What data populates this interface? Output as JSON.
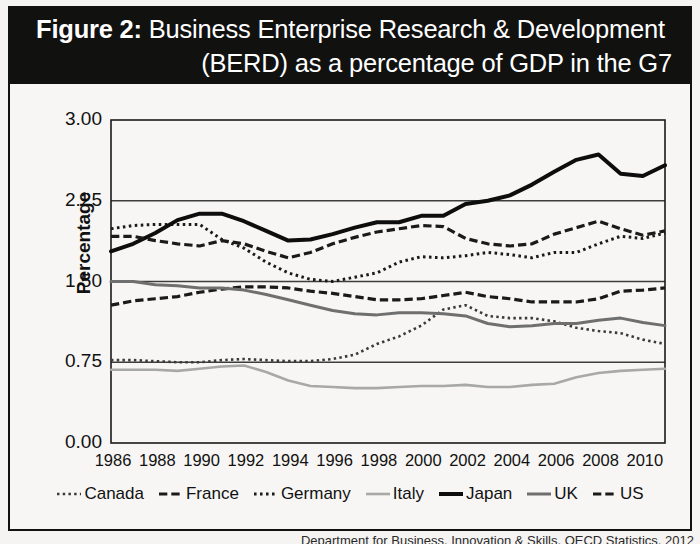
{
  "title": {
    "prefix": "Figure 2:",
    "line1": "Business Enterprise Research & Development",
    "line2": "(BERD) as a percentage of GDP in the G7"
  },
  "source_note": "Department for Business, Innovation & Skills, OECD Statistics, 2012",
  "axis": {
    "ylabel": "Percentage",
    "yticks": [
      "0.00",
      "0.75",
      "1.50",
      "2.25",
      "3.00"
    ],
    "xticks": [
      "1986",
      "1988",
      "1990",
      "1992",
      "1994",
      "1996",
      "1998",
      "2000",
      "2002",
      "2004",
      "2006",
      "2008",
      "2010"
    ]
  },
  "legend": {
    "items": [
      {
        "label": "Canada",
        "style": "dotted",
        "color": "#3a3a3a",
        "width": 2.6
      },
      {
        "label": "France",
        "style": "dashed",
        "color": "#1a1a1a",
        "width": 3.2
      },
      {
        "label": "Germany",
        "style": "finedotted",
        "color": "#1a1a1a",
        "width": 3.0
      },
      {
        "label": "Italy",
        "style": "solid",
        "color": "#a8a8a8",
        "width": 2.6
      },
      {
        "label": "Japan",
        "style": "solid",
        "color": "#0d0d0d",
        "width": 4.0
      },
      {
        "label": "UK",
        "style": "solid",
        "color": "#6f6f6f",
        "width": 3.0
      },
      {
        "label": "US",
        "style": "dashed",
        "color": "#1a1a1a",
        "width": 3.2
      }
    ]
  },
  "chart_data": {
    "type": "line",
    "title": "Figure 2: Business Enterprise Research & Development (BERD) as a percentage of GDP in the G7",
    "xlabel": "",
    "ylabel": "Percentage",
    "ylim": [
      0.0,
      3.0
    ],
    "xlim": [
      1986,
      2011
    ],
    "yticks": [
      0.0,
      0.75,
      1.5,
      2.25,
      3.0
    ],
    "grid": "horizontal",
    "legend_position": "bottom",
    "x": [
      1986,
      1987,
      1988,
      1989,
      1990,
      1991,
      1992,
      1993,
      1994,
      1995,
      1996,
      1997,
      1998,
      1999,
      2000,
      2001,
      2002,
      2003,
      2004,
      2005,
      2006,
      2007,
      2008,
      2009,
      2010,
      2011
    ],
    "series": [
      {
        "name": "Canada",
        "values": [
          0.77,
          0.77,
          0.76,
          0.75,
          0.75,
          0.77,
          0.78,
          0.77,
          0.76,
          0.76,
          0.78,
          0.82,
          0.92,
          0.99,
          1.09,
          1.24,
          1.28,
          1.18,
          1.16,
          1.16,
          1.13,
          1.07,
          1.04,
          1.02,
          0.96,
          0.92
        ]
      },
      {
        "name": "France",
        "values": [
          1.28,
          1.32,
          1.34,
          1.36,
          1.4,
          1.43,
          1.45,
          1.45,
          1.44,
          1.41,
          1.39,
          1.36,
          1.33,
          1.33,
          1.34,
          1.37,
          1.4,
          1.36,
          1.34,
          1.31,
          1.31,
          1.31,
          1.34,
          1.41,
          1.42,
          1.44
        ]
      },
      {
        "name": "Germany",
        "values": [
          1.99,
          2.02,
          2.03,
          2.03,
          2.03,
          1.89,
          1.81,
          1.68,
          1.58,
          1.52,
          1.5,
          1.54,
          1.58,
          1.68,
          1.73,
          1.72,
          1.74,
          1.77,
          1.75,
          1.72,
          1.77,
          1.77,
          1.85,
          1.92,
          1.9,
          1.95
        ]
      },
      {
        "name": "Italy",
        "values": [
          0.68,
          0.68,
          0.68,
          0.67,
          0.69,
          0.71,
          0.72,
          0.66,
          0.58,
          0.53,
          0.52,
          0.51,
          0.51,
          0.52,
          0.53,
          0.53,
          0.54,
          0.52,
          0.52,
          0.54,
          0.55,
          0.61,
          0.65,
          0.67,
          0.68,
          0.69
        ]
      },
      {
        "name": "Japan",
        "values": [
          1.78,
          1.85,
          1.95,
          2.07,
          2.13,
          2.13,
          2.06,
          1.97,
          1.88,
          1.89,
          1.94,
          2.0,
          2.05,
          2.05,
          2.11,
          2.11,
          2.22,
          2.25,
          2.3,
          2.4,
          2.52,
          2.63,
          2.68,
          2.5,
          2.48,
          2.58
        ]
      },
      {
        "name": "UK",
        "values": [
          1.5,
          1.5,
          1.47,
          1.46,
          1.44,
          1.44,
          1.42,
          1.38,
          1.33,
          1.28,
          1.23,
          1.2,
          1.19,
          1.21,
          1.21,
          1.2,
          1.18,
          1.11,
          1.08,
          1.09,
          1.11,
          1.11,
          1.14,
          1.16,
          1.12,
          1.09
        ]
      },
      {
        "name": "US",
        "values": [
          1.92,
          1.92,
          1.88,
          1.85,
          1.83,
          1.88,
          1.85,
          1.78,
          1.72,
          1.77,
          1.85,
          1.91,
          1.96,
          1.99,
          2.02,
          2.01,
          1.9,
          1.85,
          1.83,
          1.85,
          1.94,
          2.0,
          2.06,
          1.99,
          1.93,
          1.97
        ]
      }
    ]
  }
}
